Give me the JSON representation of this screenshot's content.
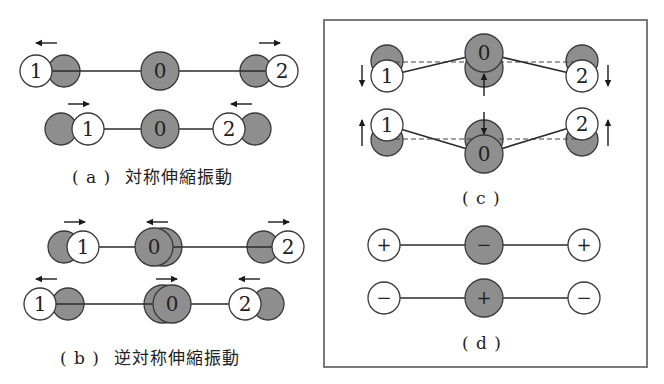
{
  "colors": {
    "grey_atom": "#8e8e8e",
    "white_atom": "#ffffff",
    "stroke": "#3a3a3a",
    "bond": "#2a2a2a",
    "box_border": "#7a7a7a"
  },
  "panels": {
    "a": {
      "tag": "( a )",
      "title": "対称伸縮振動",
      "rows": [
        {
          "y": 71,
          "bond": [
            36,
            282
          ],
          "atoms": [
            {
              "x": 64,
              "r": 16,
              "fill": "grey",
              "label": ""
            },
            {
              "x": 36,
              "r": 16,
              "fill": "white",
              "label": "1"
            },
            {
              "x": 160,
              "r": 19,
              "fill": "grey",
              "label": "0"
            },
            {
              "x": 256,
              "r": 16,
              "fill": "grey",
              "label": ""
            },
            {
              "x": 282,
              "r": 16,
              "fill": "white",
              "label": "2"
            }
          ],
          "arrows": [
            {
              "x1": 57,
              "y1": 43,
              "x2": 36,
              "y2": 43
            },
            {
              "x1": 259,
              "y1": 43,
              "x2": 280,
              "y2": 43
            }
          ]
        },
        {
          "y": 129,
          "bond": [
            88,
            229
          ],
          "atoms": [
            {
              "x": 61,
              "r": 16,
              "fill": "grey",
              "label": ""
            },
            {
              "x": 88,
              "r": 16,
              "fill": "white",
              "label": "1"
            },
            {
              "x": 160,
              "r": 19,
              "fill": "grey",
              "label": "0"
            },
            {
              "x": 255,
              "r": 16,
              "fill": "grey",
              "label": ""
            },
            {
              "x": 229,
              "r": 16,
              "fill": "white",
              "label": "2"
            }
          ],
          "arrows": [
            {
              "x1": 68,
              "y1": 104,
              "x2": 89,
              "y2": 104
            },
            {
              "x1": 252,
              "y1": 104,
              "x2": 231,
              "y2": 104
            }
          ]
        }
      ]
    },
    "b": {
      "tag": "( b )",
      "title": "逆対称伸縮振動",
      "rows": [
        {
          "y": 247,
          "bond": [
            83,
            288
          ],
          "atoms": [
            {
              "x": 64,
              "r": 16,
              "fill": "grey",
              "label": ""
            },
            {
              "x": 83,
              "r": 16,
              "fill": "white",
              "label": "1"
            },
            {
              "x": 163,
              "r": 19,
              "fill": "grey",
              "label": ""
            },
            {
              "x": 154,
              "r": 19,
              "fill": "grey",
              "label": "0"
            },
            {
              "x": 263,
              "r": 16,
              "fill": "grey",
              "label": ""
            },
            {
              "x": 288,
              "r": 16,
              "fill": "white",
              "label": "2"
            }
          ],
          "arrows": [
            {
              "x1": 64,
              "y1": 222,
              "x2": 85,
              "y2": 222
            },
            {
              "x1": 168,
              "y1": 222,
              "x2": 147,
              "y2": 222
            },
            {
              "x1": 268,
              "y1": 222,
              "x2": 289,
              "y2": 222
            }
          ]
        },
        {
          "y": 304,
          "bond": [
            40,
            245
          ],
          "atoms": [
            {
              "x": 68,
              "r": 16,
              "fill": "grey",
              "label": ""
            },
            {
              "x": 40,
              "r": 16,
              "fill": "white",
              "label": "1"
            },
            {
              "x": 163,
              "r": 19,
              "fill": "grey",
              "label": ""
            },
            {
              "x": 172,
              "r": 19,
              "fill": "grey",
              "label": "0"
            },
            {
              "x": 268,
              "r": 16,
              "fill": "grey",
              "label": ""
            },
            {
              "x": 245,
              "r": 16,
              "fill": "white",
              "label": "2"
            }
          ],
          "arrows": [
            {
              "x1": 57,
              "y1": 279,
              "x2": 36,
              "y2": 279
            },
            {
              "x1": 156,
              "y1": 279,
              "x2": 177,
              "y2": 279
            },
            {
              "x1": 260,
              "y1": 279,
              "x2": 239,
              "y2": 279
            }
          ]
        }
      ]
    },
    "c": {
      "tag": "( c )",
      "rows": [
        {
          "dash_y": 62,
          "dash": [
            387,
            582
          ],
          "bonds": [
            [
              387,
              76,
              484,
              53
            ],
            [
              484,
              53,
              582,
              76
            ]
          ],
          "atoms": [
            {
              "x": 387,
              "y": 61,
              "r": 16,
              "fill": "grey",
              "label": ""
            },
            {
              "x": 387,
              "y": 76,
              "r": 16,
              "fill": "white",
              "label": "1"
            },
            {
              "x": 484,
              "y": 68,
              "r": 19,
              "fill": "grey",
              "label": ""
            },
            {
              "x": 484,
              "y": 53,
              "r": 19,
              "fill": "grey",
              "label": "0"
            },
            {
              "x": 582,
              "y": 61,
              "r": 16,
              "fill": "grey",
              "label": ""
            },
            {
              "x": 582,
              "y": 76,
              "r": 16,
              "fill": "white",
              "label": "2"
            }
          ],
          "arrows": [
            {
              "x1": 362,
              "y1": 65,
              "x2": 362,
              "y2": 86
            },
            {
              "x1": 484,
              "y1": 96,
              "x2": 484,
              "y2": 74
            },
            {
              "x1": 608,
              "y1": 65,
              "x2": 608,
              "y2": 86
            }
          ]
        },
        {
          "dash_y": 139,
          "dash": [
            387,
            582
          ],
          "bonds": [
            [
              387,
              125,
              484,
              154
            ],
            [
              484,
              154,
              582,
              124
            ]
          ],
          "atoms": [
            {
              "x": 387,
              "y": 140,
              "r": 16,
              "fill": "grey",
              "label": ""
            },
            {
              "x": 387,
              "y": 125,
              "r": 16,
              "fill": "white",
              "label": "1"
            },
            {
              "x": 484,
              "y": 139,
              "r": 19,
              "fill": "grey",
              "label": ""
            },
            {
              "x": 484,
              "y": 154,
              "r": 19,
              "fill": "grey",
              "label": "0"
            },
            {
              "x": 582,
              "y": 140,
              "r": 16,
              "fill": "grey",
              "label": ""
            },
            {
              "x": 582,
              "y": 124,
              "r": 16,
              "fill": "white",
              "label": "2"
            }
          ],
          "arrows": [
            {
              "x1": 362,
              "y1": 146,
              "x2": 362,
              "y2": 120
            },
            {
              "x1": 484,
              "y1": 112,
              "x2": 484,
              "y2": 134
            },
            {
              "x1": 608,
              "y1": 146,
              "x2": 608,
              "y2": 120
            }
          ]
        }
      ]
    },
    "d": {
      "tag": "( d )",
      "rows": [
        {
          "y": 245,
          "bond": [
            384,
            584
          ],
          "atoms": [
            {
              "x": 384,
              "r": 16,
              "fill": "white",
              "label": "+"
            },
            {
              "x": 484,
              "r": 19,
              "fill": "grey",
              "label": "−"
            },
            {
              "x": 584,
              "r": 16,
              "fill": "white",
              "label": "+"
            }
          ]
        },
        {
          "y": 298,
          "bond": [
            384,
            584
          ],
          "atoms": [
            {
              "x": 384,
              "r": 16,
              "fill": "white",
              "label": "−"
            },
            {
              "x": 484,
              "r": 19,
              "fill": "grey",
              "label": "+"
            },
            {
              "x": 584,
              "r": 16,
              "fill": "white",
              "label": "−"
            }
          ]
        }
      ]
    }
  }
}
